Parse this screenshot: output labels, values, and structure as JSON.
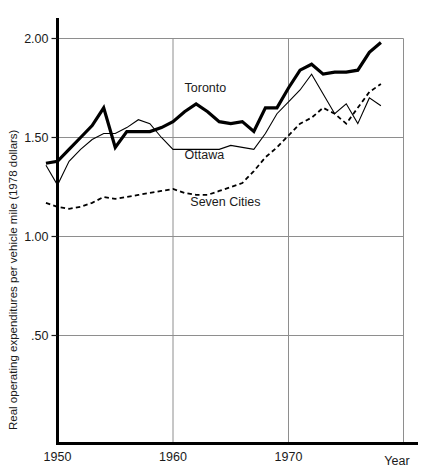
{
  "chart_data": {
    "type": "line",
    "title": "",
    "xlabel": "Year",
    "ylabel": "Real operating expenditures per vehicle mile (1978 dollars)",
    "xlim": [
      1949,
      1980
    ],
    "ylim": [
      0,
      2.05
    ],
    "grid": true,
    "legend_position": "inline-annotations",
    "xticks": [
      1950,
      1960,
      1970
    ],
    "xtick_labels": [
      "1950",
      "1960",
      "1970"
    ],
    "yticks": [
      0.5,
      1.0,
      1.5,
      2.0
    ],
    "ytick_labels": [
      ".50",
      "1.00",
      "1.50",
      "2.00"
    ],
    "series": [
      {
        "name": "Toronto",
        "style": "thick-solid",
        "color": "#000000",
        "x": [
          1949,
          1950,
          1951,
          1952,
          1953,
          1954,
          1955,
          1956,
          1957,
          1958,
          1959,
          1960,
          1961,
          1962,
          1963,
          1964,
          1965,
          1966,
          1967,
          1968,
          1969,
          1970,
          1971,
          1972,
          1973,
          1974,
          1975,
          1976,
          1977,
          1978
        ],
        "values": [
          1.37,
          1.38,
          1.44,
          1.5,
          1.56,
          1.65,
          1.45,
          1.53,
          1.53,
          1.53,
          1.55,
          1.58,
          1.63,
          1.67,
          1.63,
          1.58,
          1.57,
          1.58,
          1.53,
          1.65,
          1.65,
          1.75,
          1.84,
          1.87,
          1.82,
          1.83,
          1.83,
          1.84,
          1.93,
          1.98
        ]
      },
      {
        "name": "Ottawa",
        "style": "thin-solid",
        "color": "#000000",
        "x": [
          1949,
          1950,
          1951,
          1952,
          1953,
          1954,
          1955,
          1956,
          1957,
          1958,
          1959,
          1960,
          1961,
          1962,
          1963,
          1964,
          1965,
          1966,
          1967,
          1968,
          1969,
          1970,
          1971,
          1972,
          1973,
          1974,
          1975,
          1976,
          1977,
          1978
        ],
        "values": [
          1.36,
          1.26,
          1.38,
          1.44,
          1.49,
          1.52,
          1.52,
          1.55,
          1.59,
          1.57,
          1.5,
          1.44,
          1.44,
          1.44,
          1.44,
          1.44,
          1.46,
          1.45,
          1.44,
          1.52,
          1.62,
          1.68,
          1.74,
          1.82,
          1.72,
          1.62,
          1.67,
          1.57,
          1.7,
          1.66
        ]
      },
      {
        "name": "Seven Cities",
        "style": "dashed",
        "color": "#000000",
        "x": [
          1949,
          1950,
          1951,
          1952,
          1953,
          1954,
          1955,
          1956,
          1957,
          1958,
          1959,
          1960,
          1961,
          1962,
          1963,
          1964,
          1965,
          1966,
          1967,
          1968,
          1969,
          1970,
          1971,
          1972,
          1973,
          1974,
          1975,
          1976,
          1977,
          1978
        ],
        "values": [
          1.17,
          1.15,
          1.14,
          1.15,
          1.17,
          1.2,
          1.19,
          1.2,
          1.21,
          1.22,
          1.23,
          1.24,
          1.22,
          1.21,
          1.21,
          1.23,
          1.25,
          1.27,
          1.33,
          1.4,
          1.45,
          1.51,
          1.57,
          1.6,
          1.65,
          1.62,
          1.57,
          1.65,
          1.73,
          1.77
        ]
      }
    ],
    "annotations": [
      {
        "text": "Toronto",
        "x": 1961.0,
        "y": 1.73
      },
      {
        "text": "Ottawa",
        "x": 1961.0,
        "y": 1.39
      },
      {
        "text": "Seven Cities",
        "x": 1961.5,
        "y": 1.155
      }
    ]
  },
  "axes": {
    "x_name": "Year",
    "y_title": "Real operating expenditures per vehicle mile (1978 dollars)"
  }
}
